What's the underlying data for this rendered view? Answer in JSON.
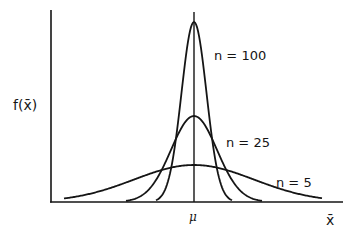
{
  "chart_data": {
    "type": "line",
    "title": "",
    "xlabel": "x̄",
    "ylabel": "f(x̄)",
    "x_tick_labels": [
      "μ"
    ],
    "grid": false,
    "legend": "inline labels on curves",
    "mean_marker": "μ",
    "series": [
      {
        "name": "n = 100",
        "label": "n=100",
        "relative_peak_height": 0.95,
        "relative_spread": 0.13,
        "shape": "normal"
      },
      {
        "name": "n = 25",
        "label": "n=25",
        "relative_peak_height": 0.46,
        "relative_spread": 0.25,
        "shape": "normal"
      },
      {
        "name": "n = 5",
        "label": "n=5",
        "relative_peak_height": 0.2,
        "relative_spread": 0.55,
        "shape": "normal"
      }
    ]
  },
  "labels": {
    "y_axis": "f(x̄)",
    "x_axis": "x̄",
    "mean": "μ",
    "n100": "n = 100",
    "n25": "n = 25",
    "n5": "n = 5"
  }
}
